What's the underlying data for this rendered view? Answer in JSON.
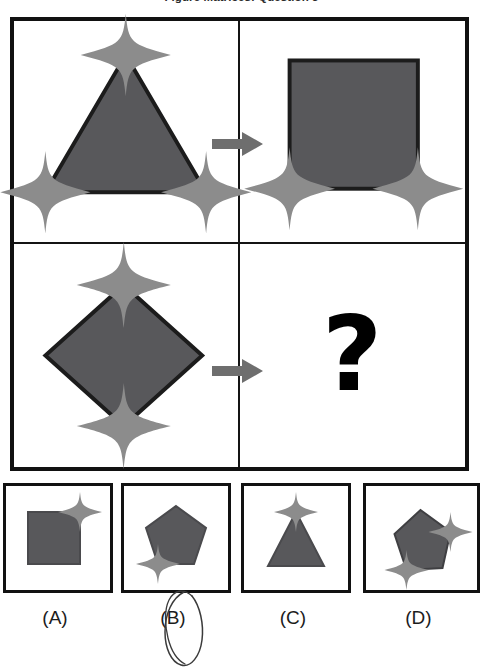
{
  "page": {
    "title": "Figure Matrices: Question 3",
    "question_mark": "?"
  },
  "colors": {
    "shape_fill": "#58585b",
    "shape_outline": "#1c1c1c",
    "star_fill": "#8c8c8c",
    "arrow_fill": "#6e6e6e",
    "frame": "#111111",
    "background": "#ffffff",
    "annotation_ink": "#3b3b3b"
  },
  "matrix": {
    "rows": 2,
    "columns": 2,
    "cells": [
      {
        "position": "top-left",
        "shape": "triangle",
        "shape_label": "triangle-with-three-stars",
        "star_count": 3,
        "star_positions": [
          "top-apex",
          "bottom-left-vertex",
          "bottom-right-vertex"
        ]
      },
      {
        "position": "top-right",
        "shape": "square",
        "shape_label": "square-with-two-stars",
        "star_count": 2,
        "star_positions": [
          "bottom-left-corner",
          "bottom-right-corner"
        ]
      },
      {
        "position": "bottom-left",
        "shape": "diamond",
        "shape_label": "diamond-with-two-stars",
        "star_count": 2,
        "star_positions": [
          "top-vertex",
          "bottom-vertex"
        ]
      },
      {
        "position": "bottom-right",
        "shape": "question-mark",
        "shape_label": "unknown-answer",
        "star_count": 0,
        "star_positions": []
      }
    ],
    "arrows": [
      {
        "row": 1,
        "direction": "right",
        "label": "transform-arrow-row-1"
      },
      {
        "row": 2,
        "direction": "right",
        "label": "transform-arrow-row-2"
      }
    ]
  },
  "options": [
    {
      "key": "A",
      "label": "(A)",
      "shape": "square",
      "star_count": 1,
      "star_positions": [
        "top-right-corner"
      ],
      "selected": false
    },
    {
      "key": "B",
      "label": "(B)",
      "shape": "pentagon",
      "star_count": 1,
      "star_positions": [
        "bottom-left-vertex"
      ],
      "selected": true
    },
    {
      "key": "C",
      "label": "(C)",
      "shape": "triangle",
      "star_count": 1,
      "star_positions": [
        "top-apex"
      ],
      "selected": false
    },
    {
      "key": "D",
      "label": "(D)",
      "shape": "pentagon-rotated",
      "star_count": 2,
      "star_positions": [
        "right-vertex",
        "bottom-left-vertex"
      ],
      "selected": false
    }
  ],
  "annotation": {
    "type": "hand-drawn-oval",
    "target": "(B)",
    "label": "handwritten-circle-around-option-b"
  }
}
